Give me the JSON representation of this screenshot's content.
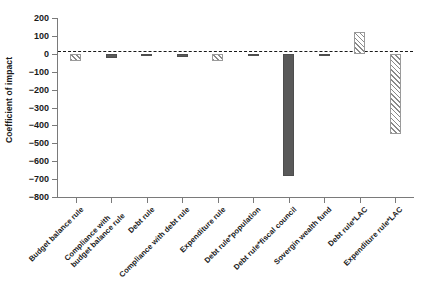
{
  "chart_data": {
    "type": "bar",
    "title": "",
    "xlabel": "",
    "ylabel": "Coefficient of impact",
    "ylim": [
      -800,
      200
    ],
    "yticks": [
      200,
      100,
      0,
      -100,
      -200,
      -300,
      -400,
      -500,
      -600,
      -700,
      -800
    ],
    "ytick_labels": [
      "200",
      "100",
      "0",
      "−100",
      "−200",
      "−300",
      "−400",
      "−500",
      "−600",
      "−700",
      "−800"
    ],
    "grid": false,
    "legend": "none",
    "zero_reference_line": 0,
    "categories": [
      "Budget balance rule",
      "Compliance with budget balance rule",
      "Debt rule",
      "Compliance with debt rule",
      "Expenditure rule",
      "Debt rule*population",
      "Debt rule*fiscal council",
      "Sovergin wealth fund",
      "Debt rule*LAC",
      "Expenditure rule*LAC"
    ],
    "values": [
      -40,
      -25,
      0,
      -20,
      -40,
      -10,
      -680,
      -5,
      120,
      -450
    ],
    "bar_styles": [
      "hatch",
      "solid",
      "solid",
      "solid",
      "hatch",
      "solid",
      "solid",
      "solid",
      "hatch",
      "hatch"
    ],
    "colors": {
      "solid_fill": "#595959",
      "hatch_fill": "#ffffff",
      "hatch_line": "#8a8a8a",
      "axis": "#7a7a7a",
      "text": "#1a1a1a"
    }
  },
  "axis": {
    "y_title": "Coefficient of impact"
  },
  "xlabels": [
    {
      "line1": "Budget balance rule",
      "line2": ""
    },
    {
      "line1": "Compliance with",
      "line2": "budget balance rule"
    },
    {
      "line1": "Debt rule",
      "line2": ""
    },
    {
      "line1": "Compliance with debt rule",
      "line2": ""
    },
    {
      "line1": "Expenditure rule",
      "line2": ""
    },
    {
      "line1": "Debt rule*population",
      "line2": ""
    },
    {
      "line1": "Debt rule*fiscal council",
      "line2": ""
    },
    {
      "line1": "Sovergin wealth fund",
      "line2": ""
    },
    {
      "line1": "Debt rule*LAC",
      "line2": ""
    },
    {
      "line1": "Expenditure rule*LAC",
      "line2": ""
    }
  ]
}
